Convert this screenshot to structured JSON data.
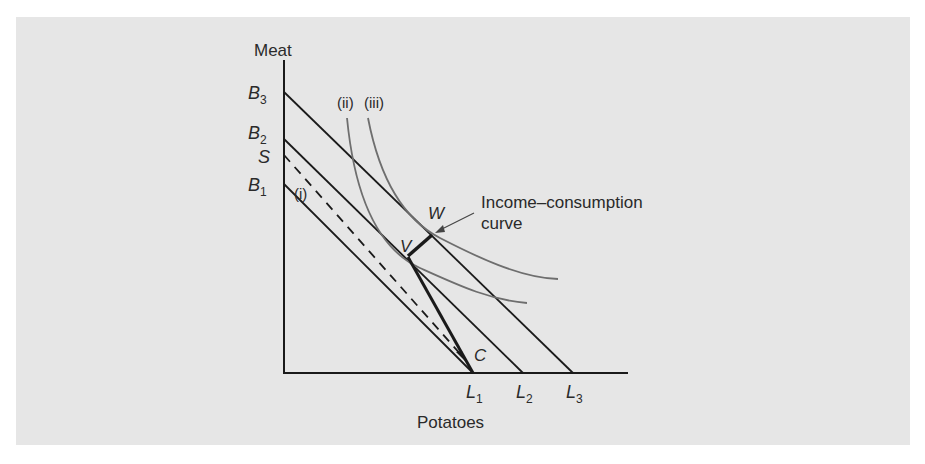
{
  "figure": {
    "y_axis_label": "Meat",
    "x_axis_label": "Potatoes",
    "y_intercepts": [
      {
        "letter": "B",
        "sub": "3"
      },
      {
        "letter": "B",
        "sub": "2"
      },
      {
        "letter": "S",
        "sub": ""
      },
      {
        "letter": "B",
        "sub": "1"
      }
    ],
    "x_intercepts": [
      {
        "letter": "L",
        "sub": "1"
      },
      {
        "letter": "L",
        "sub": "2"
      },
      {
        "letter": "L",
        "sub": "3"
      }
    ],
    "curve_labels": {
      "i": "(i)",
      "ii": "(ii)",
      "iii": "(iii)"
    },
    "points": {
      "V": "V",
      "W": "W",
      "C": "C"
    },
    "annotation": {
      "line1": "Income–consumption",
      "line2": "curve"
    }
  },
  "colors": {
    "background": "#e6e6e6",
    "line": "#1a1a1a",
    "curve": "#6e6e6e"
  }
}
